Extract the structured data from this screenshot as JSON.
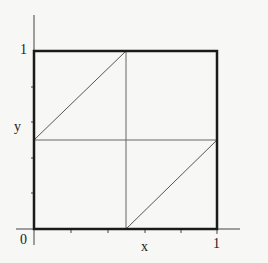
{
  "diagram": {
    "labels": {
      "origin": "0",
      "x_tick_one": "1",
      "y_tick_one": "1",
      "x_axis": "x",
      "y_axis": "y"
    },
    "colors": {
      "box": "#1a1a1a",
      "lines": "#555555",
      "background": "#f7f7f5"
    },
    "axis_ticks": 5
  }
}
